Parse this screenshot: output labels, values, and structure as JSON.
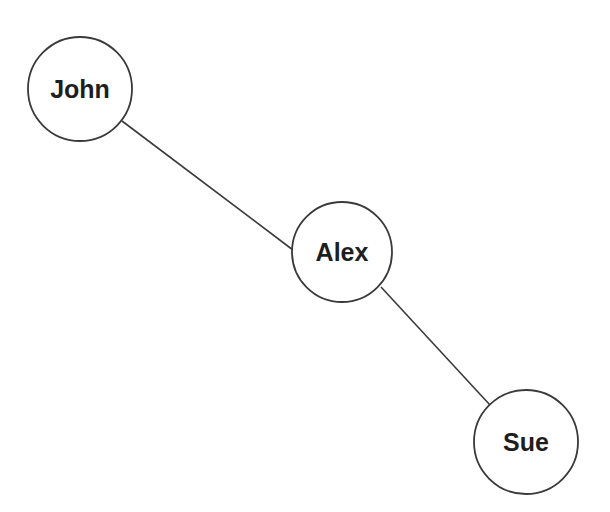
{
  "diagram": {
    "type": "undirected-graph",
    "nodes": [
      {
        "id": "john",
        "label": "John",
        "cx": 80,
        "cy": 89,
        "r": 52
      },
      {
        "id": "alex",
        "label": "Alex",
        "cx": 342,
        "cy": 252,
        "r": 50
      },
      {
        "id": "sue",
        "label": "Sue",
        "cx": 526,
        "cy": 442,
        "r": 52
      }
    ],
    "edges": [
      {
        "from": "john",
        "to": "alex",
        "x1": 122,
        "y1": 121,
        "x2": 293,
        "y2": 250
      },
      {
        "from": "alex",
        "to": "sue",
        "x1": 381,
        "y1": 287,
        "x2": 490,
        "y2": 405
      }
    ],
    "colors": {
      "stroke": "#3a3a3a",
      "label": "#1e1e1e",
      "background": "#ffffff"
    }
  }
}
